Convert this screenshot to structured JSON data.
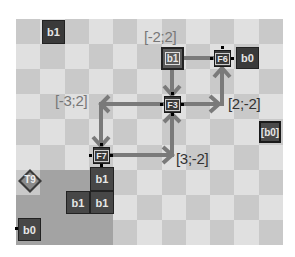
{
  "board": {
    "cols": 11,
    "rows": 9,
    "colors": {
      "light": "#e0e0e0",
      "dark": "#c9c9c9",
      "shade": "#a3a3a3",
      "block": "#3a3a3a",
      "arrow": "#7a7a7a"
    }
  },
  "blocks": [
    {
      "id": "b1-top",
      "label": "b1"
    },
    {
      "id": "b1-junction",
      "label": "b1"
    },
    {
      "id": "b0-right-of-f6",
      "label": "b0"
    },
    {
      "id": "b0-right-edge",
      "label": "[b0]"
    },
    {
      "id": "b1-stack-top",
      "label": "b1"
    },
    {
      "id": "b1-stack-left",
      "label": "b1"
    },
    {
      "id": "b1-stack-right",
      "label": "b1"
    },
    {
      "id": "b0-bottom-left",
      "label": "b0"
    }
  ],
  "nodes": {
    "f3": "F3",
    "f6": "F6",
    "f7": "F7",
    "t9": "T9"
  },
  "coordinate_labels": {
    "top": "[-2;2]",
    "left": "[-3;2]",
    "right": "[2;-2]",
    "bottom": "[3;-2]"
  }
}
